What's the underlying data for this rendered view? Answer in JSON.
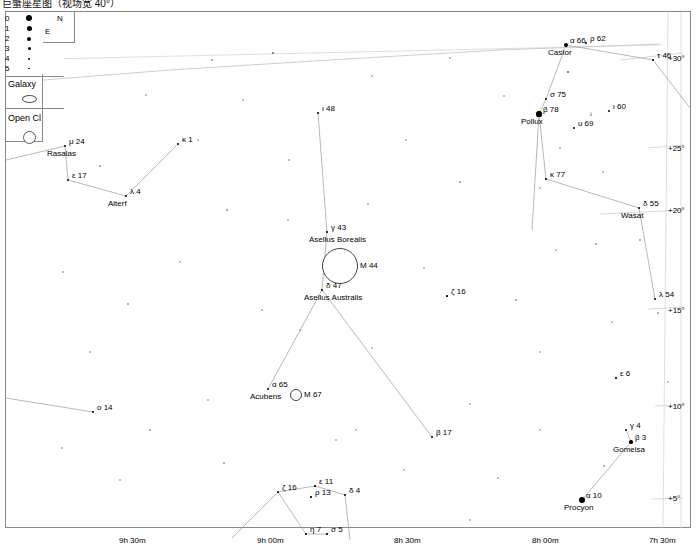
{
  "title": "巨蟹座星图（视场宽 40°）",
  "legend": {
    "magnitudes": [
      {
        "label": "0",
        "size": 6
      },
      {
        "label": "1",
        "size": 5.2
      },
      {
        "label": "2",
        "size": 4.4
      },
      {
        "label": "3",
        "size": 3.4
      },
      {
        "label": "4",
        "size": 2.4
      },
      {
        "label": "5",
        "size": 1.6
      }
    ],
    "galaxy_label": "Galaxy",
    "opencluster_label": "Open Cl",
    "compass_n": "N",
    "compass_e": "E"
  },
  "chart_data": {
    "type": "scatter",
    "title": "巨蟹座星图（视场宽 40°）",
    "xlabel": "Right Ascension",
    "ylabel": "Declination",
    "grid": true,
    "ra_ticks": [
      "9h 30m",
      "9h 00m",
      "8h 30m",
      "8h 00m",
      "7h 30m"
    ],
    "dec_ticks": [
      "+30°",
      "+25°",
      "+20°",
      "+15°",
      "+10°",
      "+5°"
    ],
    "stars": [
      {
        "bayer": "μ 24",
        "name": "Rasalas",
        "x": 65,
        "y": 146,
        "mag": 3.9
      },
      {
        "bayer": "ε 17",
        "name": "",
        "x": 68,
        "y": 180,
        "mag": 4.2
      },
      {
        "bayer": "λ 4",
        "name": "Alterf",
        "x": 126,
        "y": 196,
        "mag": 4.3
      },
      {
        "bayer": "κ 1",
        "name": "",
        "x": 178,
        "y": 144,
        "mag": 4.4
      },
      {
        "bayer": "ο 14",
        "name": "",
        "x": 93,
        "y": 412,
        "mag": 4.4
      },
      {
        "bayer": "ι 48",
        "name": "",
        "x": 318,
        "y": 113,
        "mag": 4.0
      },
      {
        "bayer": "γ 43",
        "name": "Asellus Borealis",
        "x": 327,
        "y": 232,
        "mag": 4.6
      },
      {
        "bayer": "δ 47",
        "name": "Asellus Australis",
        "x": 322,
        "y": 290,
        "mag": 3.9
      },
      {
        "bayer": "ζ 16",
        "name": "",
        "x": 447,
        "y": 296,
        "mag": 4.7
      },
      {
        "bayer": "α 65",
        "name": "Acubens",
        "x": 268,
        "y": 389,
        "mag": 4.3
      },
      {
        "bayer": "β 17",
        "name": "",
        "x": 432,
        "y": 437,
        "mag": 3.5
      },
      {
        "bayer": "ζ 16",
        "name": "",
        "x": 278,
        "y": 492,
        "mag": 4.6
      },
      {
        "bayer": "ε 11",
        "name": "",
        "x": 315,
        "y": 486,
        "mag": 4.7
      },
      {
        "bayer": "ρ 13",
        "name": "",
        "x": 311,
        "y": 497,
        "mag": 5.0
      },
      {
        "bayer": "δ 4",
        "name": "",
        "x": 345,
        "y": 495,
        "mag": 4.5
      },
      {
        "bayer": "η 7",
        "name": "",
        "x": 306,
        "y": 534,
        "mag": 4.6
      },
      {
        "bayer": "σ 5",
        "name": "",
        "x": 327,
        "y": 534,
        "mag": 4.8
      },
      {
        "bayer": "α 66",
        "name": "Castor",
        "x": 566,
        "y": 45,
        "mag": 1.6
      },
      {
        "bayer": "ρ 62",
        "name": "",
        "x": 586,
        "y": 43,
        "mag": 4.2
      },
      {
        "bayer": "τ 46",
        "name": "",
        "x": 653,
        "y": 60,
        "mag": 4.4
      },
      {
        "bayer": "σ 75",
        "name": "",
        "x": 546,
        "y": 99,
        "mag": 4.2
      },
      {
        "bayer": "β 78",
        "name": "Pollux",
        "x": 539,
        "y": 114,
        "mag": 1.1
      },
      {
        "bayer": "υ 69",
        "name": "",
        "x": 574,
        "y": 128,
        "mag": 4.1
      },
      {
        "bayer": "ι 60",
        "name": "",
        "x": 609,
        "y": 111,
        "mag": 3.8
      },
      {
        "bayer": "κ 77",
        "name": "",
        "x": 546,
        "y": 179,
        "mag": 3.6
      },
      {
        "bayer": "δ 55",
        "name": "Wasat",
        "x": 639,
        "y": 208,
        "mag": 3.5
      },
      {
        "bayer": "λ 54",
        "name": "",
        "x": 655,
        "y": 299,
        "mag": 3.6
      },
      {
        "bayer": "ε 6",
        "name": "",
        "x": 616,
        "y": 378,
        "mag": 5.0
      },
      {
        "bayer": "γ 4",
        "name": "",
        "x": 626,
        "y": 430,
        "mag": 4.1
      },
      {
        "bayer": "β 3",
        "name": "Gomeisa",
        "x": 631,
        "y": 442,
        "mag": 2.9
      },
      {
        "bayer": "α 10",
        "name": "Procyon",
        "x": 582,
        "y": 500,
        "mag": 0.4
      }
    ],
    "deep_sky": [
      {
        "label": "M 44",
        "type": "open-cluster",
        "x": 339,
        "y": 265,
        "radius": 17
      },
      {
        "label": "M 67",
        "type": "open-cluster",
        "x": 295,
        "y": 394,
        "radius": 5
      }
    ]
  }
}
